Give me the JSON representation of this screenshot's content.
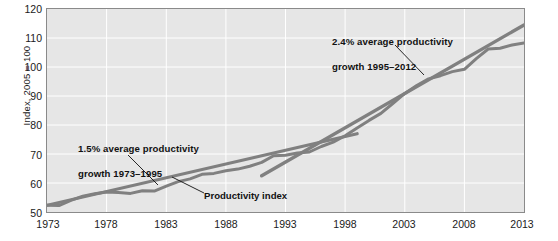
{
  "chart_data": {
    "type": "line",
    "title": "",
    "xlabel": "",
    "ylabel": "Index, 2005 = 100",
    "xlim": [
      1973,
      2013
    ],
    "ylim": [
      50,
      120
    ],
    "grid": true,
    "legend": "none",
    "y_ticks": [
      50,
      60,
      70,
      80,
      90,
      100,
      110,
      120
    ],
    "x_ticks": [
      1973,
      1978,
      1983,
      1988,
      1993,
      1998,
      2003,
      2008,
      2013
    ],
    "series": [
      {
        "name": "Productivity index",
        "color": "#808080",
        "x": [
          1973,
          1974,
          1975,
          1976,
          1977,
          1978,
          1979,
          1980,
          1981,
          1982,
          1983,
          1984,
          1985,
          1986,
          1987,
          1988,
          1989,
          1990,
          1991,
          1992,
          1993,
          1994,
          1995,
          1996,
          1997,
          1998,
          1999,
          2000,
          2001,
          2002,
          2003,
          2004,
          2005,
          2006,
          2007,
          2008,
          2009,
          2010,
          2011,
          2012,
          2013
        ],
        "values": [
          52.3,
          52.2,
          54.0,
          55.5,
          56.3,
          56.9,
          56.7,
          56.4,
          57.3,
          57.2,
          58.9,
          60.5,
          61.4,
          63.0,
          63.3,
          64.2,
          64.8,
          65.8,
          67.1,
          69.4,
          69.6,
          70.3,
          70.7,
          72.6,
          74.1,
          76.3,
          79.0,
          81.6,
          84.0,
          87.4,
          90.9,
          93.6,
          95.9,
          97.0,
          98.4,
          99.2,
          102.9,
          106.2,
          106.5,
          107.6,
          108.3
        ]
      },
      {
        "name": "1.5% average productivity growth trend 1973-1995",
        "color": "#808080",
        "x": [
          1973,
          1999
        ],
        "values": [
          52.3,
          77.0
        ]
      },
      {
        "name": "2.4% average productivity growth trend 1995-2012",
        "color": "#808080",
        "x": [
          1991,
          2013
        ],
        "values": [
          62.5,
          114.5
        ]
      }
    ],
    "annotations": [
      {
        "id": "early-trend",
        "text": "1.5% average productivity\ngrowth 1973–1995",
        "line_1": "1.5% average productivity",
        "line_2": "growth 1973–1995",
        "points_to_x": 1982,
        "points_to_y": 61.5
      },
      {
        "id": "late-trend",
        "text": "2.4% average productivity\ngrowth 1995–2012",
        "line_1": "2.4% average productivity",
        "line_2": "growth 1995–2012",
        "points_to_x": 2002,
        "points_to_y": 91.5
      },
      {
        "id": "series-label",
        "text": "Productivity index",
        "points_to_x": 1984,
        "points_to_y": 58.8
      }
    ]
  },
  "axes": {
    "y_title": "Index, 2005 = 100",
    "y_tick_labels": [
      "120",
      "110",
      "100",
      "90",
      "80",
      "70",
      "60",
      "50"
    ],
    "x_tick_labels": [
      "1973",
      "1978",
      "1983",
      "1988",
      "1993",
      "1998",
      "2003",
      "2008",
      "2013"
    ]
  },
  "annotations": {
    "early_line1": "1.5% average productivity",
    "early_line2": "growth 1973–1995",
    "late_line1": "2.4% average productivity",
    "late_line2": "growth 1995–2012",
    "series_label": "Productivity index"
  },
  "colors": {
    "plot_background": "#e6e6e6",
    "gridline": "#ffffff",
    "line": "#808080",
    "axis_border": "#8a8a8a",
    "text": "#1a1a1a"
  }
}
